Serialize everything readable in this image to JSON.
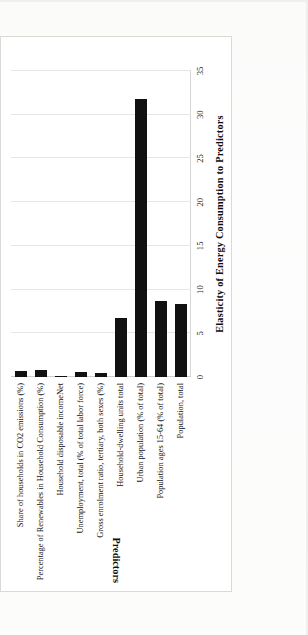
{
  "caption": "Figure 10-13. Results of the elasticity analysis for Sweden.",
  "chart_data": {
    "type": "bar",
    "orientation": "vertical",
    "title": "",
    "xlabel": "Elasticity  of Energy  Consumption  to Predictors",
    "ylabel": "Predictors",
    "categories": [
      "Share of households in CO2 emissions (%)",
      "Percentage of Renewables in Household Consumption (%)",
      "Household disposable incomeNet",
      "Unemployment, total (% of total labor force)",
      "Gross enrolment ratio, tertiary, both sexes (%)",
      "Household-dwelling units total",
      "Urban population (% of total)",
      "Population ages 15-64 (% of total)",
      "Population, total"
    ],
    "values": [
      0.7,
      0.8,
      0.1,
      0.6,
      0.5,
      6.7,
      31.8,
      8.7,
      8.4
    ],
    "ylim": [
      0,
      35
    ],
    "ticks": [
      "0",
      "5",
      "10",
      "15",
      "20",
      "25",
      "30",
      "35"
    ],
    "tick_values": [
      0,
      5,
      10,
      15,
      20,
      25,
      30,
      35
    ],
    "grid": true,
    "legend": false,
    "bar_color": "#111111",
    "grid_color": "#e6e6e4"
  }
}
